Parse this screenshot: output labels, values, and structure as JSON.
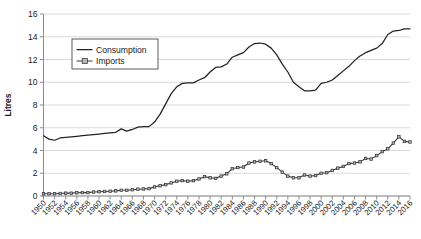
{
  "chart_data": {
    "type": "line",
    "title": "",
    "xlabel": "",
    "ylabel": "Litres",
    "ylim": [
      0,
      16
    ],
    "ytick_step": 2,
    "yticks": [
      0,
      2,
      4,
      6,
      8,
      10,
      12,
      14,
      16
    ],
    "grid": true,
    "legend_position": "upper-left-inset",
    "xlim": [
      1950,
      2016
    ],
    "xtick_step": 2,
    "xtick_labels": [
      "1950",
      "1952",
      "1954",
      "1956",
      "1958",
      "1960",
      "1962",
      "1964",
      "1966",
      "1968",
      "1970",
      "1972",
      "1974",
      "1976",
      "1978",
      "1980",
      "1982",
      "1984",
      "1986",
      "1988",
      "1990",
      "1992",
      "1994",
      "1996",
      "1998",
      "2000",
      "2002",
      "2004",
      "2006",
      "2008",
      "2010",
      "2012",
      "2014",
      "2016"
    ],
    "x": [
      1950,
      1951,
      1952,
      1953,
      1954,
      1955,
      1956,
      1957,
      1958,
      1959,
      1960,
      1961,
      1962,
      1963,
      1964,
      1965,
      1966,
      1967,
      1968,
      1969,
      1970,
      1971,
      1972,
      1973,
      1974,
      1975,
      1976,
      1977,
      1978,
      1979,
      1980,
      1981,
      1982,
      1983,
      1984,
      1985,
      1986,
      1987,
      1988,
      1989,
      1990,
      1991,
      1992,
      1993,
      1994,
      1995,
      1996,
      1997,
      1998,
      1999,
      2000,
      2001,
      2002,
      2003,
      2004,
      2005,
      2006,
      2007,
      2008,
      2009,
      2010,
      2011,
      2012,
      2013,
      2014,
      2015,
      2016
    ],
    "series": [
      {
        "name": "Consumption",
        "style": "solid-line",
        "color": "#222222",
        "values": [
          5.3,
          5.0,
          4.9,
          5.1,
          5.15,
          5.2,
          5.25,
          5.3,
          5.35,
          5.4,
          5.45,
          5.5,
          5.55,
          5.6,
          5.9,
          5.7,
          5.85,
          6.05,
          6.1,
          6.1,
          6.5,
          7.2,
          8.1,
          9.0,
          9.6,
          9.9,
          9.95,
          9.95,
          10.2,
          10.4,
          10.9,
          11.3,
          11.35,
          11.6,
          12.2,
          12.4,
          12.6,
          13.1,
          13.4,
          13.45,
          13.35,
          13.0,
          12.4,
          11.6,
          10.9,
          10.0,
          9.6,
          9.25,
          9.25,
          9.3,
          9.9,
          10.0,
          10.2,
          10.6,
          11.0,
          11.4,
          11.9,
          12.3,
          12.6,
          12.8,
          13.0,
          13.4,
          14.2,
          14.5,
          14.55,
          14.7,
          14.7
        ]
      },
      {
        "name": "Imports",
        "style": "line-with-square-markers",
        "color": "#3b3b3b",
        "marker_fill": "#b8b8b8",
        "values": [
          0.2,
          0.2,
          0.2,
          0.22,
          0.25,
          0.25,
          0.28,
          0.3,
          0.3,
          0.35,
          0.38,
          0.4,
          0.42,
          0.45,
          0.5,
          0.5,
          0.55,
          0.6,
          0.62,
          0.65,
          0.8,
          0.9,
          1.0,
          1.15,
          1.3,
          1.35,
          1.3,
          1.35,
          1.5,
          1.7,
          1.6,
          1.55,
          1.75,
          1.95,
          2.4,
          2.5,
          2.55,
          2.9,
          3.0,
          3.05,
          3.1,
          2.85,
          2.5,
          2.1,
          1.75,
          1.6,
          1.6,
          1.85,
          1.75,
          1.8,
          2.0,
          2.05,
          2.25,
          2.45,
          2.6,
          2.85,
          2.9,
          3.0,
          3.3,
          3.25,
          3.55,
          3.9,
          4.15,
          4.65,
          5.2,
          4.8,
          4.75
        ]
      }
    ]
  },
  "legend": {
    "entries": [
      {
        "label": "Consumption"
      },
      {
        "label": "Imports"
      }
    ]
  },
  "axes": {
    "y_title": "Litres"
  }
}
